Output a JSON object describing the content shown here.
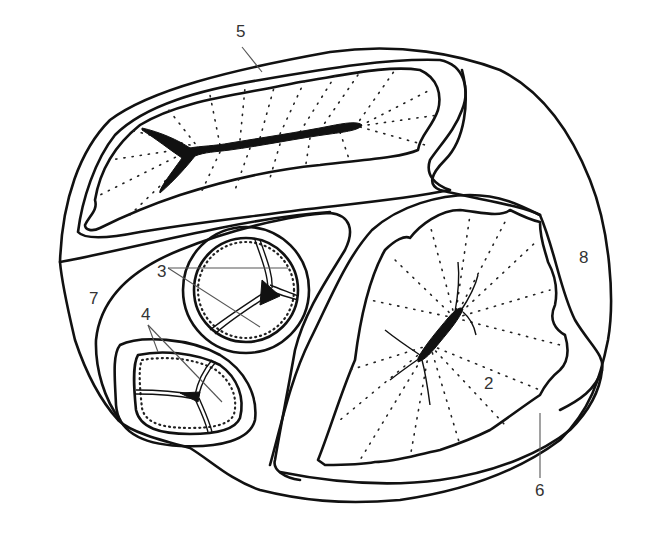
{
  "figure": {
    "type": "anatomical line drawing (cross-section)",
    "labels": [
      {
        "id": "5",
        "text": "5",
        "x": 236,
        "y": 37
      },
      {
        "id": "3",
        "text": "3",
        "x": 157,
        "y": 277
      },
      {
        "id": "4",
        "text": "4",
        "x": 141,
        "y": 320
      },
      {
        "id": "7",
        "text": "7",
        "x": 89,
        "y": 304
      },
      {
        "id": "8",
        "text": "8",
        "x": 579,
        "y": 263
      },
      {
        "id": "2",
        "text": "2",
        "x": 484,
        "y": 389
      },
      {
        "id": "6",
        "text": "6",
        "x": 535,
        "y": 496
      }
    ]
  },
  "colors": {
    "ink": "#111111",
    "leader": "#555555",
    "label": "#333333",
    "background": "#ffffff"
  }
}
